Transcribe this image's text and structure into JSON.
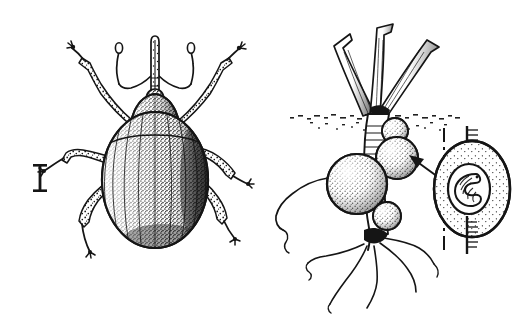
{
  "figure": {
    "kind": "scientific-line-illustration",
    "background_color": "#ffffff",
    "ink_color": "#151515",
    "width_px": 527,
    "height_px": 317,
    "panel_count": 2,
    "caption_text": "",
    "has_visible_text_labels": false
  },
  "panels": {
    "left": {
      "name": "weevil-dorsal-view",
      "subject": "adult weevil (Curculionidae), dorsal aspect",
      "orientation": "head up",
      "parts": [
        {
          "id": "rostrum",
          "label": "rostrum",
          "description": "long slender snout projecting forward from head"
        },
        {
          "id": "antennae",
          "label": "antennae",
          "description": "pair of geniculate (elbowed) antennae with clubbed tips, arising from rostrum"
        },
        {
          "id": "head",
          "label": "head",
          "description": "small stippled head behind rostrum"
        },
        {
          "id": "pronotum",
          "label": "pronotum",
          "description": "bell-shaped thorax shield, densely stippled, dark along right margin"
        },
        {
          "id": "elytra",
          "label": "elytra",
          "description": "broad oval wing cases with longitudinal striae and dense stipple shading, darkest on right edge"
        },
        {
          "id": "legs",
          "label": "legs",
          "description": "three pairs of legs, each with stippled femur, slender tibia and small tarsal claw"
        }
      ],
      "scale_bar": {
        "name": "scale-bar",
        "style": "I-beam",
        "label": "",
        "position": "left of specimen, mid-height"
      }
    },
    "right": {
      "name": "galled-root-with-inset",
      "subject": "host plant root bearing weevil galls",
      "parts": [
        {
          "id": "leaf-blades",
          "label": "leaf blades",
          "description": "three cut shoot blades rising above the soil line, hatch-shaded on one side"
        },
        {
          "id": "soil-line",
          "label": "soil line",
          "description": "horizontal stippled band marking ground level"
        },
        {
          "id": "crown",
          "label": "crown",
          "description": "ribbed stem base just below soil line"
        },
        {
          "id": "galls",
          "label": "galls",
          "description": "cluster of four spherical stippled swellings on the root, largest on the left"
        },
        {
          "id": "taproot",
          "label": "taproot",
          "description": "main root descending below the galls"
        },
        {
          "id": "root-hairs",
          "label": "lateral roots",
          "description": "wavy fine lateral roots spreading from the root base"
        }
      ],
      "arrow": {
        "name": "pointer-arrow",
        "direction": "up-left",
        "meaning": "links inset cross-section to a gall on the root"
      },
      "inset": {
        "name": "gall-cross-section",
        "description": "longitudinal cut through a gall showing the internal chamber",
        "parts": [
          {
            "id": "cut-plane-line",
            "label": "cut plane",
            "description": "dashed vertical line indicating the section plane"
          },
          {
            "id": "gall-wall",
            "label": "gall wall",
            "description": "oval stippled swelling around the stem"
          },
          {
            "id": "stem-axis",
            "label": "stem",
            "description": "hatched stem passing through the gall above and below"
          },
          {
            "id": "larva",
            "label": "larva",
            "description": "C-shaped grub curled inside the central chamber"
          },
          {
            "id": "chamber",
            "label": "larval chamber",
            "description": "hollow cavity enclosing the larva"
          }
        ]
      }
    }
  }
}
